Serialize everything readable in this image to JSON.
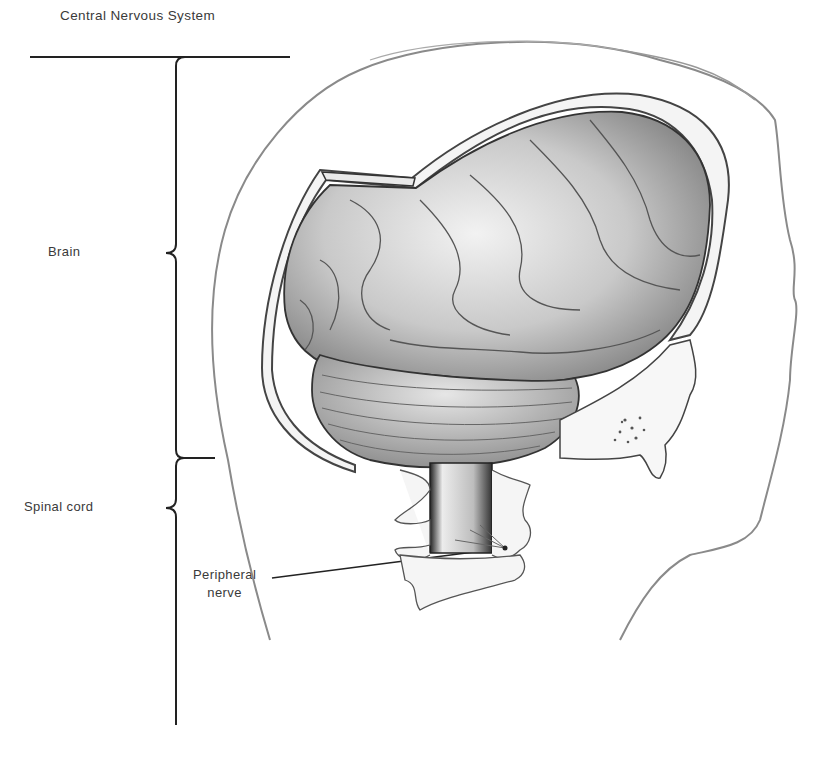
{
  "diagram": {
    "title": "Central Nervous System",
    "type": "anatomical illustration",
    "colors": {
      "background": "#ffffff",
      "line": "#222222",
      "label_text": "#3a3a3a",
      "illustration_tone": "#8a8a8a"
    },
    "labels": [
      {
        "id": "brain",
        "text": "Brain",
        "pointer": "brace"
      },
      {
        "id": "spinal_cord",
        "text": "Spinal cord",
        "pointer": "brace"
      },
      {
        "id": "peripheral_nerve",
        "line1": "Peripheral",
        "line2": "nerve",
        "pointer": "leader-line"
      }
    ],
    "structures": [
      "head-outline",
      "skull-cut-edge",
      "cerebrum",
      "cerebellum",
      "spinal-cord",
      "cervical-vertebrae",
      "temporal-bone"
    ]
  }
}
